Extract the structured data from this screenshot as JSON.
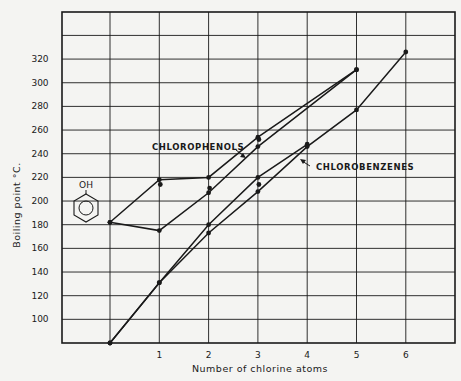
{
  "chart_data": {
    "type": "line",
    "title": "",
    "xlabel": "Number of chlorine atoms",
    "ylabel": "Boiling point °C.",
    "x_ticks": [
      "1",
      "2",
      "3",
      "4",
      "5",
      "6"
    ],
    "y_ticks": [
      "100",
      "120",
      "140",
      "160",
      "180",
      "200",
      "220",
      "240",
      "260",
      "280",
      "300",
      "320"
    ],
    "xlim": [
      -1,
      7
    ],
    "ylim": [
      80,
      360
    ],
    "grid": true,
    "legend": "none (inline annotations)",
    "annotations": [
      {
        "text": "CHLOROPHENOLS",
        "target": "chlorophenol series"
      },
      {
        "text": "CHLOROBENZENES",
        "target": "chlorobenzene series"
      },
      {
        "text": "OH",
        "note": "phenol structure (benzene ring with OH) drawn at y≈180"
      }
    ],
    "series": [
      {
        "name": "Chlorophenols (upper branch)",
        "x": [
          0,
          1,
          2,
          3,
          5
        ],
        "y": [
          182,
          218,
          220,
          254,
          311
        ]
      },
      {
        "name": "Chlorophenols (lower branch)",
        "x": [
          0,
          1,
          2,
          3,
          5
        ],
        "y": [
          182,
          175,
          207,
          246,
          311
        ]
      },
      {
        "name": "Chlorobenzenes (upper branch)",
        "x": [
          0,
          1,
          2,
          3,
          4
        ],
        "y": [
          80,
          131,
          180,
          220,
          248
        ]
      },
      {
        "name": "Chlorobenzenes (lower branch)",
        "x": [
          0,
          1,
          2,
          3,
          4,
          5,
          6
        ],
        "y": [
          80,
          131,
          173,
          208,
          246,
          277,
          326
        ]
      }
    ],
    "extra_points": [
      {
        "x": 1,
        "y": 214
      },
      {
        "x": 2,
        "y": 211
      },
      {
        "x": 3,
        "y": 252
      },
      {
        "x": 3,
        "y": 214
      }
    ]
  },
  "labels": {
    "xlabel": "Number of chlorine atoms",
    "ylabel": "Boiling point °C.",
    "chlorophenols": "CHLOROPHENOLS",
    "chlorobenzenes": "CHLOROBENZENES",
    "oh": "OH"
  },
  "style": {
    "ink": "#1a1a1a",
    "paper": "#f4f4f2"
  }
}
